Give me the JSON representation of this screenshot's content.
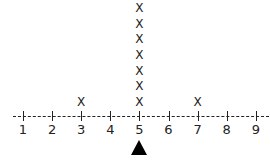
{
  "chart_data": {
    "type": "dot_plot",
    "title": "",
    "xlabel": "",
    "ylabel": "",
    "marker": "X",
    "x_ticks": [
      1,
      2,
      3,
      4,
      5,
      6,
      7,
      8,
      9
    ],
    "xlim": [
      1,
      9
    ],
    "counts": [
      {
        "x": 1,
        "count": 0
      },
      {
        "x": 2,
        "count": 0
      },
      {
        "x": 3,
        "count": 1
      },
      {
        "x": 4,
        "count": 0
      },
      {
        "x": 5,
        "count": 7
      },
      {
        "x": 6,
        "count": 0
      },
      {
        "x": 7,
        "count": 1
      },
      {
        "x": 8,
        "count": 0
      },
      {
        "x": 9,
        "count": 0
      }
    ],
    "total_points": 9,
    "annotation": {
      "type": "triangle-pointer",
      "at_x": 5,
      "meaning": "balance point / mean"
    },
    "grid": false,
    "axis_style": "dashed"
  },
  "labels": {
    "ticks": [
      "1",
      "2",
      "3",
      "4",
      "5",
      "6",
      "7",
      "8",
      "9"
    ],
    "marker_glyph": "X"
  }
}
